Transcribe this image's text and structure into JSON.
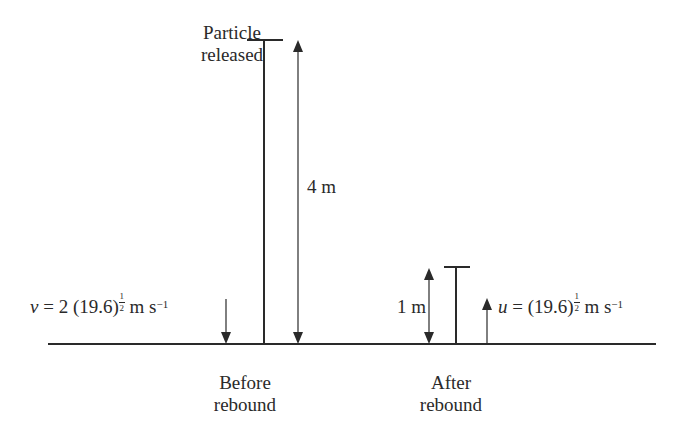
{
  "diagram": {
    "title_top": {
      "line1": "Particle",
      "line2": "released"
    },
    "height_before": "4 m",
    "height_after": "1 m",
    "velocity_before": {
      "symbol": "v",
      "equals": "=",
      "coef": "2 (19.6)",
      "exp_num": "1",
      "exp_den": "2",
      "unit": "m s",
      "unit_exp": "−1"
    },
    "velocity_after": {
      "symbol": "u",
      "equals": "=",
      "coef": "(19.6)",
      "exp_num": "1",
      "exp_den": "2",
      "unit": "m s",
      "unit_exp": "−1"
    },
    "label_before": {
      "line1": "Before",
      "line2": "rebound"
    },
    "label_after": {
      "line1": "After",
      "line2": "rebound"
    },
    "colors": {
      "line": "#2a2a2a",
      "background": "#ffffff"
    }
  }
}
